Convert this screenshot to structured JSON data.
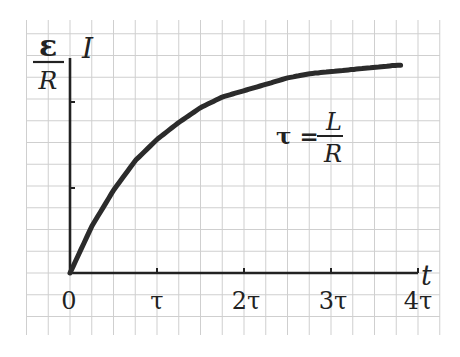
{
  "chart_data": {
    "type": "line",
    "title": "",
    "xlabel": "t",
    "ylabel": "I",
    "x_ticks": [
      "0",
      "τ",
      "2τ",
      "3τ",
      "4τ"
    ],
    "y_ticks": [
      "ε/R"
    ],
    "y_asymptote_label": {
      "numerator": "ε",
      "denominator": "R"
    },
    "annotation": {
      "lhs": "τ =",
      "numerator": "L",
      "denominator": "R"
    },
    "grid": true,
    "legend": null,
    "xlim": [
      0,
      4
    ],
    "ylim": [
      0,
      1
    ],
    "series": [
      {
        "name": "I(t) = (ε/R)(1 − e^(−t/τ))",
        "x": [
          0,
          0.25,
          0.5,
          0.75,
          1.0,
          1.25,
          1.5,
          1.75,
          2.0,
          2.25,
          2.5,
          2.75,
          3.0,
          3.25,
          3.5,
          3.75
        ],
        "values": [
          0,
          0.22,
          0.39,
          0.53,
          0.63,
          0.71,
          0.78,
          0.83,
          0.86,
          0.89,
          0.92,
          0.94,
          0.95,
          0.96,
          0.97,
          0.98
        ]
      }
    ],
    "colors": {
      "curve": "#2b2b2b",
      "axes": "#222222",
      "grid": "#cfcfcf"
    }
  },
  "labels": {
    "y_axis": "I",
    "x_axis": "t",
    "asymptote_num": "ε",
    "asymptote_den": "R",
    "tick_0": "0",
    "tick_1": "τ",
    "tick_2": "2τ",
    "tick_3": "3τ",
    "tick_4": "4τ",
    "tau_lhs": "τ =",
    "tau_num": "L",
    "tau_den": "R"
  }
}
